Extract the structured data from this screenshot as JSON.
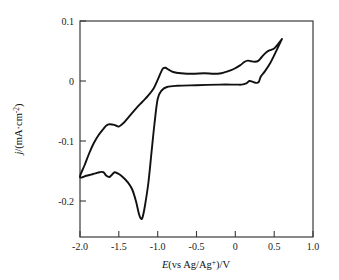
{
  "chart_data": {
    "type": "line",
    "title": "",
    "subtitle": "",
    "xlabel": "E(vs  Ag/Ag+)/V",
    "ylabel": "j/(mA·cm-2)",
    "xlabel_parts": {
      "italic": "E",
      "rest": "(vs  Ag/Ag",
      "sup": "+",
      "tail": ")/V"
    },
    "ylabel_parts": {
      "italic": "j",
      "rest": "/(mA·cm",
      "sup": "-2",
      "tail": ")"
    },
    "xlim": [
      -2.25,
      1.0
    ],
    "ylim": [
      -0.25,
      0.1
    ],
    "xticks": [
      -2.0,
      -1.5,
      -1.0,
      -0.5,
      0,
      0.5,
      1.0
    ],
    "xtick_labels": [
      "-2.0",
      "-1.5",
      "-1.0",
      "-0.5",
      "0",
      "0.5",
      "1.0"
    ],
    "yticks": [
      0.1,
      0,
      -0.1,
      -0.2
    ],
    "ytick_labels": [
      "0.1",
      "0",
      "-0.1",
      "-0.2"
    ],
    "grid": false,
    "legend": "none",
    "curve_color": "#111111",
    "axis_color": "#3a3a3a",
    "series": [
      {
        "name": "cyclic voltammogram",
        "comment": "single closed CV loop; forward = cathodic (negative-going) sweep, reverse = anodic sweep",
        "points_forward_cathodic": [
          [
            0.6,
            0.07
          ],
          [
            0.52,
            0.048
          ],
          [
            0.45,
            0.03
          ],
          [
            0.38,
            0.016
          ],
          [
            0.33,
            0.008
          ],
          [
            0.3,
            -0.002
          ],
          [
            0.26,
            -0.003
          ],
          [
            0.22,
            -0.001
          ],
          [
            0.18,
            0.0
          ],
          [
            0.14,
            -0.004
          ],
          [
            0.08,
            -0.006
          ],
          [
            0.0,
            -0.006
          ],
          [
            -0.2,
            -0.006
          ],
          [
            -0.5,
            -0.007
          ],
          [
            -0.75,
            -0.008
          ],
          [
            -0.88,
            -0.01
          ],
          [
            -0.95,
            -0.016
          ],
          [
            -1.0,
            -0.03
          ],
          [
            -1.04,
            -0.07
          ],
          [
            -1.08,
            -0.12
          ],
          [
            -1.12,
            -0.17
          ],
          [
            -1.16,
            -0.205
          ],
          [
            -1.19,
            -0.225
          ],
          [
            -1.21,
            -0.23
          ],
          [
            -1.24,
            -0.222
          ],
          [
            -1.28,
            -0.2
          ],
          [
            -1.33,
            -0.18
          ],
          [
            -1.39,
            -0.168
          ],
          [
            -1.45,
            -0.16
          ],
          [
            -1.5,
            -0.155
          ],
          [
            -1.55,
            -0.152
          ],
          [
            -1.58,
            -0.155
          ],
          [
            -1.62,
            -0.16
          ],
          [
            -1.66,
            -0.158
          ],
          [
            -1.7,
            -0.152
          ],
          [
            -1.75,
            -0.152
          ],
          [
            -1.8,
            -0.154
          ],
          [
            -1.86,
            -0.156
          ],
          [
            -1.92,
            -0.158
          ],
          [
            -2.0,
            -0.16
          ]
        ],
        "points_reverse_anodic": [
          [
            -2.0,
            -0.16
          ],
          [
            -1.94,
            -0.14
          ],
          [
            -1.88,
            -0.12
          ],
          [
            -1.82,
            -0.103
          ],
          [
            -1.76,
            -0.09
          ],
          [
            -1.7,
            -0.08
          ],
          [
            -1.66,
            -0.074
          ],
          [
            -1.62,
            -0.072
          ],
          [
            -1.56,
            -0.073
          ],
          [
            -1.5,
            -0.076
          ],
          [
            -1.44,
            -0.07
          ],
          [
            -1.36,
            -0.058
          ],
          [
            -1.28,
            -0.046
          ],
          [
            -1.2,
            -0.035
          ],
          [
            -1.12,
            -0.024
          ],
          [
            -1.05,
            -0.012
          ],
          [
            -1.0,
            0.002
          ],
          [
            -0.96,
            0.014
          ],
          [
            -0.93,
            0.021
          ],
          [
            -0.9,
            0.022
          ],
          [
            -0.86,
            0.019
          ],
          [
            -0.8,
            0.015
          ],
          [
            -0.7,
            0.013
          ],
          [
            -0.55,
            0.012
          ],
          [
            -0.4,
            0.013
          ],
          [
            -0.28,
            0.012
          ],
          [
            -0.18,
            0.013
          ],
          [
            -0.1,
            0.016
          ],
          [
            -0.02,
            0.02
          ],
          [
            0.06,
            0.026
          ],
          [
            0.12,
            0.032
          ],
          [
            0.16,
            0.034
          ],
          [
            0.2,
            0.033
          ],
          [
            0.25,
            0.032
          ],
          [
            0.3,
            0.034
          ],
          [
            0.34,
            0.04
          ],
          [
            0.4,
            0.048
          ],
          [
            0.46,
            0.052
          ],
          [
            0.5,
            0.054
          ],
          [
            0.54,
            0.06
          ],
          [
            0.6,
            0.07
          ]
        ],
        "features": {
          "cathodic_peak_potential_V": -1.21,
          "cathodic_peak_current": -0.23,
          "cathodic_shoulder_V": -1.62,
          "cathodic_shoulder_current": -0.16,
          "anodic_peak_potential_V": -0.92,
          "anodic_peak_current": 0.022,
          "anodic_shoulder_V": 0.16,
          "anodic_shoulder_current": 0.034,
          "switching_potential_negative_V": -2.0,
          "switching_potential_positive_V": 0.6
        }
      }
    ]
  }
}
